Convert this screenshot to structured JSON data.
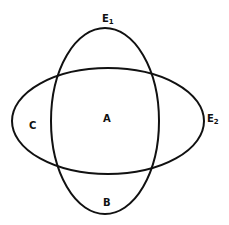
{
  "diagram": {
    "type": "overlapping-ellipses",
    "ellipses": [
      {
        "id": "E1",
        "label": "E",
        "subscript": "1",
        "orientation": "vertical",
        "cx": 105,
        "cy": 121,
        "rx": 54,
        "ry": 93
      },
      {
        "id": "E2",
        "label": "E",
        "subscript": "2",
        "orientation": "horizontal",
        "cx": 108,
        "cy": 121,
        "rx": 96,
        "ry": 53
      }
    ],
    "regions": {
      "A": "A",
      "B": "B",
      "C": "C"
    },
    "colors": {
      "stroke": "#111111",
      "background": "#ffffff"
    }
  }
}
